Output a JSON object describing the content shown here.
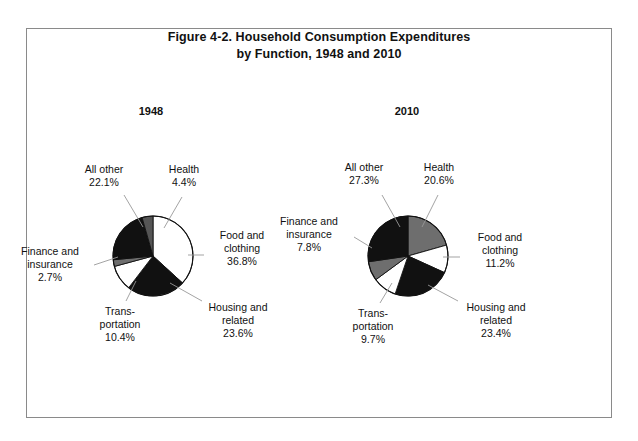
{
  "figure": {
    "title_line_1": "Figure 4-2. Household Consumption Expenditures",
    "title_line_2": "by Function, 1948 and 2010",
    "border_color": "#8a8a8a",
    "background": "#ffffff",
    "leader_line_color": "#888888"
  },
  "chart_data": [
    {
      "type": "pie",
      "title": "1948",
      "start_angle_deg": 0,
      "direction": "clockwise",
      "legend": "none",
      "grid": false,
      "categories": [
        "Food and clothing",
        "Housing and related",
        "Transportation",
        "Finance and insurance",
        "All other",
        "Health"
      ],
      "values": [
        36.8,
        23.6,
        10.4,
        2.7,
        22.1,
        4.4
      ],
      "colors": [
        "#ffffff",
        "#111111",
        "#ffffff",
        "#6e6e6e",
        "#111111",
        "#555555"
      ],
      "slices": [
        {
          "label_line_1": "Food and",
          "label_line_2": "clothing",
          "pct": "36.8%",
          "value": 36.8,
          "color": "#ffffff"
        },
        {
          "label_line_1": "Housing and",
          "label_line_2": "related",
          "pct": "23.6%",
          "value": 23.6,
          "color": "#111111"
        },
        {
          "label_line_1": "Trans-",
          "label_line_2": "portation",
          "pct": "10.4%",
          "value": 10.4,
          "color": "#ffffff"
        },
        {
          "label_line_1": "Finance and",
          "label_line_2": "insurance",
          "pct": "2.7%",
          "value": 2.7,
          "color": "#6e6e6e"
        },
        {
          "label_line_1": "All other",
          "label_line_2": "",
          "pct": "22.1%",
          "value": 22.1,
          "color": "#111111"
        },
        {
          "label_line_1": "Health",
          "label_line_2": "",
          "pct": "4.4%",
          "value": 4.4,
          "color": "#555555"
        }
      ]
    },
    {
      "type": "pie",
      "title": "2010",
      "start_angle_deg": 0,
      "direction": "clockwise",
      "legend": "none",
      "grid": false,
      "categories": [
        "Health",
        "Food and clothing",
        "Housing and related",
        "Transportation",
        "Finance and insurance",
        "All other"
      ],
      "values": [
        20.6,
        11.2,
        23.4,
        9.7,
        7.8,
        27.3
      ],
      "colors": [
        "#6e6e6e",
        "#ffffff",
        "#111111",
        "#ffffff",
        "#6e6e6e",
        "#111111"
      ],
      "slices": [
        {
          "label_line_1": "Health",
          "label_line_2": "",
          "pct": "20.6%",
          "value": 20.6,
          "color": "#6e6e6e"
        },
        {
          "label_line_1": "Food and",
          "label_line_2": "clothing",
          "pct": "11.2%",
          "value": 11.2,
          "color": "#ffffff"
        },
        {
          "label_line_1": "Housing and",
          "label_line_2": "related",
          "pct": "23.4%",
          "value": 23.4,
          "color": "#111111"
        },
        {
          "label_line_1": "Trans-",
          "label_line_2": "portation",
          "pct": "9.7%",
          "value": 9.7,
          "color": "#ffffff"
        },
        {
          "label_line_1": "Finance and",
          "label_line_2": "insurance",
          "pct": "7.8%",
          "value": 7.8,
          "color": "#6e6e6e"
        },
        {
          "label_line_1": "All other",
          "label_line_2": "",
          "pct": "27.3%",
          "value": 27.3,
          "color": "#111111"
        }
      ]
    }
  ]
}
